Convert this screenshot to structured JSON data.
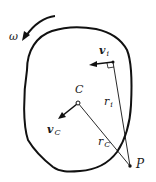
{
  "diagram": {
    "type": "rigid-body-kinematics",
    "colors": {
      "stroke": "#111111",
      "background": "#ffffff",
      "text": "#1a1a1a"
    },
    "labels": {
      "omega": "ω",
      "center": "C",
      "v_i": {
        "main": "v",
        "sub": "i"
      },
      "v_c": {
        "main": "v",
        "sub": "C"
      },
      "r_i": {
        "main": "r",
        "sub": "i"
      },
      "r_c": {
        "main": "r",
        "sub": "C"
      },
      "point": "P"
    },
    "elements": [
      "rigid-body-outline",
      "angular-velocity-arrow",
      "center-point-C",
      "velocity-vector-vC",
      "point-i",
      "velocity-vector-vi",
      "right-angle-marker",
      "position-line-ri",
      "position-line-rC",
      "point-P"
    ]
  }
}
